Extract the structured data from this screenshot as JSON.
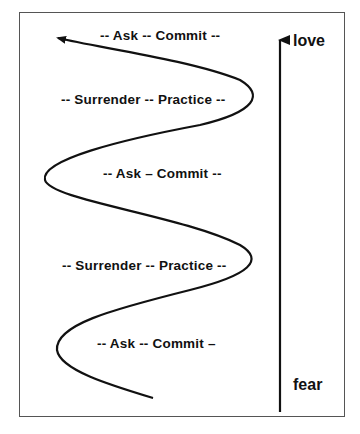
{
  "diagram": {
    "labels": [
      {
        "text": "-- Ask -- Commit --",
        "x": 100,
        "y": 28
      },
      {
        "text": "-- Surrender -- Practice --",
        "x": 61,
        "y": 92
      },
      {
        "text": "-- Ask – Commit --",
        "x": 103,
        "y": 166
      },
      {
        "text": "-- Surrender -- Practice --",
        "x": 62,
        "y": 258
      },
      {
        "text": "-- Ask -- Commit –",
        "x": 97,
        "y": 336
      }
    ],
    "axis": {
      "top_label": "love",
      "bottom_label": "fear"
    }
  }
}
